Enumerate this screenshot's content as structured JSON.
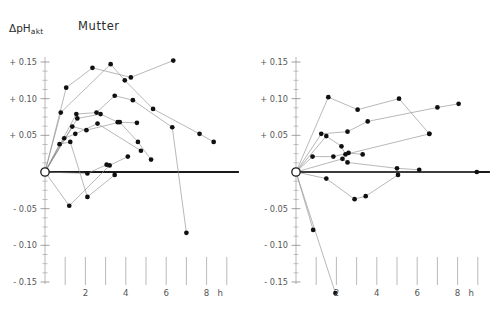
{
  "figure": {
    "y_axis_label_main": "ΔpH",
    "y_axis_label_sub": "akt",
    "x_unit": "h"
  },
  "chart_data": {
    "type": "line",
    "xlabel": "h",
    "ylabel": "ΔpH akt",
    "xlim": [
      0,
      9.4
    ],
    "ylim": [
      -0.17,
      0.16
    ],
    "grid": false,
    "legend": "none",
    "y_ticks": [
      "+ 0.15",
      "+ 0.10",
      "+ 0.05",
      "- 0.05",
      "- 0.10",
      "- 0.15"
    ],
    "y_tick_values": [
      0.15,
      0.1,
      0.05,
      -0.05,
      -0.1,
      -0.15
    ],
    "y_minor_step": 0.0125,
    "x_ticks": [
      "2",
      "4",
      "6",
      "8"
    ],
    "x_tick_values": [
      2,
      4,
      6,
      8
    ],
    "x_floating_ticks": [
      1,
      2,
      3,
      4,
      5,
      6,
      7,
      8,
      9
    ],
    "zero_line_value": 0,
    "origin_marker": "open-circle",
    "panels": [
      {
        "name": "mutter",
        "title": "Mutter",
        "series": [
          {
            "name": "m1",
            "points": [
              [
                0,
                0
              ],
              [
                1.05,
                0.115
              ],
              [
                2.35,
                0.142
              ],
              [
                4.25,
                0.129
              ],
              [
                6.35,
                0.152
              ]
            ]
          },
          {
            "name": "m2",
            "points": [
              [
                0,
                0
              ],
              [
                0.78,
                0.081
              ],
              [
                3.25,
                0.147
              ],
              [
                3.95,
                0.125
              ],
              [
                5.35,
                0.086
              ],
              [
                7.65,
                0.052
              ],
              [
                8.35,
                0.041
              ]
            ]
          },
          {
            "name": "m3",
            "points": [
              [
                0,
                0
              ],
              [
                1.55,
                0.079
              ],
              [
                2.55,
                0.081
              ],
              [
                3.45,
                0.104
              ],
              [
                4.35,
                0.098
              ],
              [
                6.3,
                0.061
              ],
              [
                7.0,
                -0.083
              ]
            ]
          },
          {
            "name": "m4",
            "points": [
              [
                0,
                0
              ],
              [
                1.6,
                0.073
              ],
              [
                2.75,
                0.079
              ],
              [
                3.6,
                0.068
              ],
              [
                4.55,
                0.067
              ]
            ]
          },
          {
            "name": "m5",
            "points": [
              [
                0,
                0
              ],
              [
                1.35,
                0.062
              ],
              [
                2.05,
                0.057
              ],
              [
                3.7,
                0.068
              ],
              [
                4.6,
                0.041
              ],
              [
                5.25,
                0.017
              ]
            ]
          },
          {
            "name": "m6",
            "points": [
              [
                0,
                0
              ],
              [
                0.95,
                0.046
              ],
              [
                1.5,
                0.052
              ],
              [
                2.6,
                0.066
              ],
              [
                4.75,
                0.029
              ]
            ]
          },
          {
            "name": "m7",
            "points": [
              [
                0,
                0
              ],
              [
                0.72,
                0.038
              ],
              [
                1.25,
                0.041
              ],
              [
                2.1,
                -0.034
              ],
              [
                3.45,
                -0.004
              ]
            ]
          },
          {
            "name": "m8",
            "points": [
              [
                0,
                0
              ],
              [
                1.2,
                -0.046
              ],
              [
                3.2,
                0.009
              ],
              [
                4.1,
                0.021
              ]
            ]
          },
          {
            "name": "m9",
            "points": [
              [
                0,
                0
              ],
              [
                2.1,
                -0.002
              ],
              [
                3.05,
                0.01
              ]
            ]
          }
        ]
      },
      {
        "name": "fetus",
        "title": "Fetus",
        "series": [
          {
            "name": "f1",
            "points": [
              [
                0,
                0
              ],
              [
                1.6,
                0.102
              ],
              [
                3.05,
                0.085
              ],
              [
                5.1,
                0.1
              ],
              [
                6.6,
                0.052
              ]
            ]
          },
          {
            "name": "f2",
            "points": [
              [
                0,
                0
              ],
              [
                1.25,
                0.052
              ],
              [
                2.55,
                0.055
              ],
              [
                3.55,
                0.069
              ],
              [
                7.0,
                0.088
              ],
              [
                8.05,
                0.093
              ]
            ]
          },
          {
            "name": "f3",
            "points": [
              [
                0,
                0
              ],
              [
                1.5,
                0.049
              ],
              [
                2.25,
                0.035
              ],
              [
                2.45,
                0.024
              ],
              [
                6.6,
                0.052
              ]
            ]
          },
          {
            "name": "f4",
            "points": [
              [
                0,
                0
              ],
              [
                0.82,
                0.021
              ],
              [
                1.85,
                0.021
              ],
              [
                2.6,
                0.026
              ],
              [
                3.3,
                0.024
              ]
            ]
          },
          {
            "name": "f5",
            "points": [
              [
                0,
                0
              ],
              [
                2.3,
                0.018
              ],
              [
                2.55,
                0.013
              ],
              [
                5.0,
                0.005
              ],
              [
                6.1,
                0.003
              ]
            ]
          },
          {
            "name": "f6",
            "points": [
              [
                0,
                0
              ],
              [
                1.5,
                -0.009
              ],
              [
                2.9,
                -0.037
              ],
              [
                3.45,
                -0.033
              ],
              [
                5.05,
                -0.004
              ]
            ]
          },
          {
            "name": "f7",
            "points": [
              [
                0,
                0
              ],
              [
                0.85,
                -0.079
              ]
            ]
          },
          {
            "name": "f8",
            "points": [
              [
                0,
                0
              ],
              [
                1.95,
                -0.165
              ]
            ]
          },
          {
            "name": "f9",
            "points": [
              [
                0,
                0
              ],
              [
                8.95,
                0.0
              ]
            ]
          }
        ]
      }
    ]
  }
}
